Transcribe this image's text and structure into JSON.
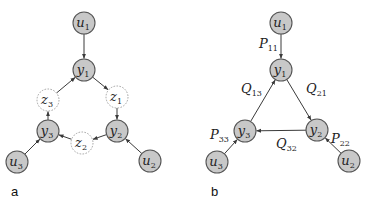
{
  "panels": [
    {
      "id": "a",
      "label": "a",
      "nodes": [
        {
          "id": "u1",
          "base": "u",
          "sub": "1",
          "style": "solid",
          "x": 84,
          "y": 23
        },
        {
          "id": "y1",
          "base": "y",
          "sub": "1",
          "style": "solid",
          "x": 84,
          "y": 70
        },
        {
          "id": "z3",
          "base": "z",
          "sub": "3",
          "style": "dashed",
          "x": 48,
          "y": 100
        },
        {
          "id": "z1",
          "base": "z",
          "sub": "1",
          "style": "dashed",
          "x": 117,
          "y": 97
        },
        {
          "id": "y3",
          "base": "y",
          "sub": "3",
          "style": "solid",
          "x": 48,
          "y": 131
        },
        {
          "id": "y2",
          "base": "y",
          "sub": "2",
          "style": "solid",
          "x": 117,
          "y": 131
        },
        {
          "id": "z2",
          "base": "z",
          "sub": "2",
          "style": "dashed",
          "x": 82,
          "y": 143
        },
        {
          "id": "u3",
          "base": "u",
          "sub": "3",
          "style": "solid",
          "x": 17,
          "y": 162
        },
        {
          "id": "u2",
          "base": "u",
          "sub": "2",
          "style": "solid",
          "x": 150,
          "y": 161
        }
      ],
      "edges": [
        {
          "from": "u1",
          "to": "y1"
        },
        {
          "from": "y1",
          "to": "z1"
        },
        {
          "from": "z1",
          "to": "y2"
        },
        {
          "from": "y2",
          "to": "z2"
        },
        {
          "from": "z2",
          "to": "y3"
        },
        {
          "from": "y3",
          "to": "z3"
        },
        {
          "from": "z3",
          "to": "y1"
        },
        {
          "from": "u2",
          "to": "y2"
        },
        {
          "from": "u3",
          "to": "y3"
        }
      ]
    },
    {
      "id": "b",
      "label": "b",
      "nodes": [
        {
          "id": "u1",
          "base": "u",
          "sub": "1",
          "style": "solid",
          "x": 281,
          "y": 23
        },
        {
          "id": "y1",
          "base": "y",
          "sub": "1",
          "style": "solid",
          "x": 281,
          "y": 70
        },
        {
          "id": "y3",
          "base": "y",
          "sub": "3",
          "style": "solid",
          "x": 245,
          "y": 131
        },
        {
          "id": "y2",
          "base": "y",
          "sub": "2",
          "style": "solid",
          "x": 317,
          "y": 130
        },
        {
          "id": "u3",
          "base": "u",
          "sub": "3",
          "style": "solid",
          "x": 217,
          "y": 162
        },
        {
          "id": "u2",
          "base": "u",
          "sub": "2",
          "style": "solid",
          "x": 349,
          "y": 161
        }
      ],
      "edges": [
        {
          "from": "u1",
          "to": "y1",
          "base": "P",
          "sub": "11",
          "lx": 259,
          "ly": 48
        },
        {
          "from": "y1",
          "to": "y2",
          "base": "Q",
          "sub": "21",
          "lx": 306,
          "ly": 93
        },
        {
          "from": "y2",
          "to": "y3",
          "base": "Q",
          "sub": "32",
          "lx": 276,
          "ly": 148
        },
        {
          "from": "y3",
          "to": "y1",
          "base": "Q",
          "sub": "13",
          "lx": 241,
          "ly": 93
        },
        {
          "from": "u2",
          "to": "y2",
          "base": "P",
          "sub": "22",
          "lx": 331,
          "ly": 143
        },
        {
          "from": "u3",
          "to": "y3",
          "base": "P",
          "sub": "33",
          "lx": 210,
          "ly": 139
        }
      ]
    }
  ],
  "panel_label_positions": {
    "a": {
      "x": 11,
      "y": 196
    },
    "b": {
      "x": 211,
      "y": 196
    }
  },
  "colors": {
    "node_fill": "#c8c8c8",
    "node_stroke": "#555555",
    "dashed_stroke": "#999999",
    "edge": "#3a3a3a"
  }
}
